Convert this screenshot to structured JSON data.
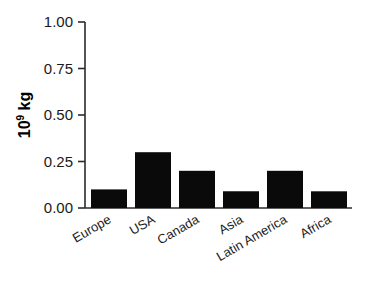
{
  "chart_data": {
    "type": "bar",
    "title": "",
    "subtitle": "",
    "xlabel": "",
    "ylabel": "10^9 kg",
    "ylabel_base": "10",
    "ylabel_exponent": "9",
    "ylabel_unit": " kg",
    "categories": [
      "Europe",
      "USA",
      "Canada",
      "Asia",
      "Latin America",
      "Africa"
    ],
    "values": [
      0.8,
      0.5,
      0.1,
      0.3,
      0.2,
      0.09
    ],
    "ylim": [
      0.0,
      1.0
    ],
    "yticks": [
      0.0,
      0.25,
      0.5,
      0.75,
      1.0
    ],
    "ytick_labels": [
      "0.00",
      "0.25",
      "0.50",
      "0.75",
      "1.00"
    ],
    "grid": false,
    "legend": false,
    "legend_position": "none",
    "bar_color": "#0a0a0a",
    "axis_color": "#2b2b2b",
    "background_color": "#ffffff",
    "xtick_label_rotation": 30
  }
}
